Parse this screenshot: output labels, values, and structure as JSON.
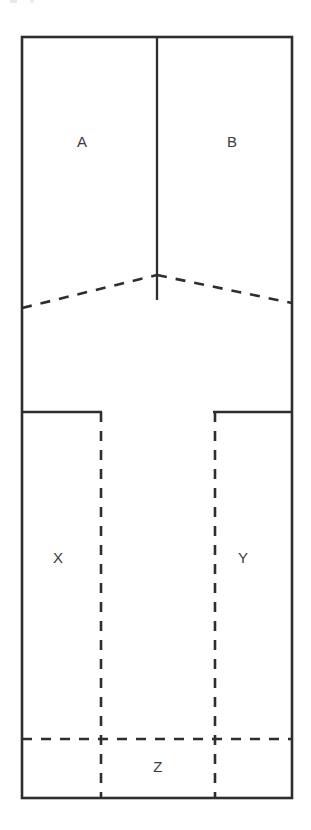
{
  "diagram": {
    "type": "line-diagram",
    "background_color": "#ffffff",
    "line_color": "#2e2e2e",
    "label_color": "#3a3a3a",
    "canvas": {
      "width": 311,
      "height": 830
    },
    "outer_rect": {
      "x": 22,
      "y": 37,
      "width": 270,
      "height": 761
    },
    "labels": [
      {
        "id": "A",
        "text": "A",
        "x": 82,
        "y": 143
      },
      {
        "id": "B",
        "text": "B",
        "x": 232,
        "y": 143
      },
      {
        "id": "X",
        "text": "X",
        "x": 58,
        "y": 559
      },
      {
        "id": "Y",
        "text": "Y",
        "x": 243,
        "y": 559
      },
      {
        "id": "Z",
        "text": "Z",
        "x": 158,
        "y": 768
      }
    ],
    "solid_segments": [
      {
        "id": "center-divider",
        "x1": 157,
        "y1": 37,
        "x2": 157,
        "y2": 300
      },
      {
        "id": "left-box-top",
        "x1": 22,
        "y1": 412,
        "x2": 101,
        "y2": 412
      },
      {
        "id": "right-box-top",
        "x1": 214,
        "y1": 412,
        "x2": 292,
        "y2": 412
      }
    ],
    "dashed_segments": [
      {
        "id": "roof-left",
        "x1": 22,
        "y1": 308,
        "x2": 157,
        "y2": 275
      },
      {
        "id": "roof-right",
        "x1": 157,
        "y1": 275,
        "x2": 292,
        "y2": 303
      },
      {
        "id": "left-box-side",
        "x1": 101,
        "y1": 412,
        "x2": 101,
        "y2": 798
      },
      {
        "id": "right-box-side",
        "x1": 214,
        "y1": 412,
        "x2": 214,
        "y2": 798
      },
      {
        "id": "z-divider",
        "x1": 22,
        "y1": 739,
        "x2": 292,
        "y2": 739
      }
    ]
  }
}
